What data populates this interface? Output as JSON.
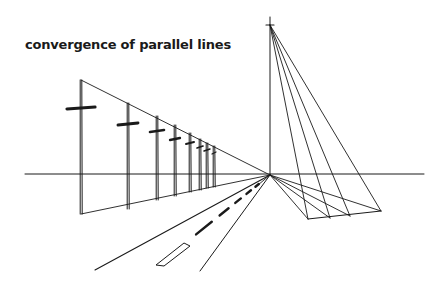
{
  "diagram": {
    "title": "convergence of parallel lines",
    "colors": {
      "ink": "#1a1a1a",
      "background": "#ffffff"
    },
    "horizon": {
      "x1": 25,
      "x2": 424,
      "y": 174
    },
    "vanishing_point": {
      "x": 270,
      "y": 175
    },
    "vertical_point": {
      "x": 270,
      "y": 25
    },
    "poles": [
      {
        "x": 81,
        "top": 80,
        "bottom": 214,
        "arm_y": 108,
        "arm_half": 14
      },
      {
        "x": 128,
        "top": 103,
        "bottom": 209,
        "arm_y": 124,
        "arm_half": 10
      },
      {
        "x": 157,
        "top": 116,
        "bottom": 200,
        "arm_y": 131,
        "arm_half": 7
      },
      {
        "x": 175,
        "top": 125,
        "bottom": 196,
        "arm_y": 139,
        "arm_half": 5
      },
      {
        "x": 190,
        "top": 133,
        "bottom": 192,
        "arm_y": 143,
        "arm_half": 4
      },
      {
        "x": 200,
        "top": 139,
        "bottom": 190,
        "arm_y": 147,
        "arm_half": 3
      },
      {
        "x": 207,
        "top": 143,
        "bottom": 188,
        "arm_y": 150,
        "arm_half": 3
      },
      {
        "x": 214,
        "top": 146,
        "bottom": 187,
        "arm_y": 153,
        "arm_half": 2
      }
    ],
    "road": {
      "left_edge_end": {
        "x": 95,
        "y": 270
      },
      "right_edge_end": {
        "x": 200,
        "y": 271
      },
      "centerline_end": {
        "x": 158,
        "y": 265
      }
    },
    "ground_points": [
      {
        "x": 308,
        "y": 219
      },
      {
        "x": 330,
        "y": 218
      },
      {
        "x": 350,
        "y": 216
      },
      {
        "x": 381,
        "y": 211
      }
    ]
  }
}
